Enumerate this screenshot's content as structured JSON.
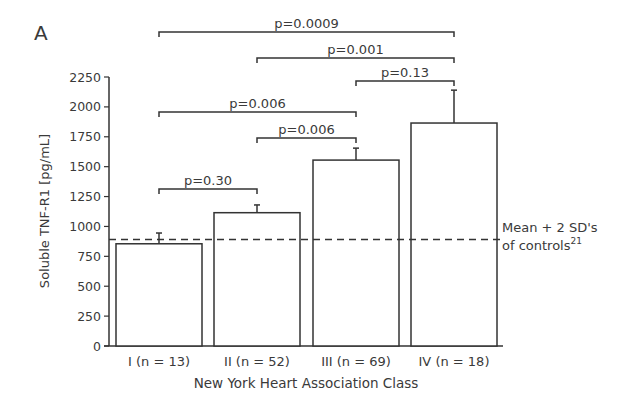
{
  "panel_label": "A",
  "chart_data": {
    "type": "bar",
    "title": "",
    "xlabel": "New York Heart Association Class",
    "ylabel": "Soluble TNF-R1 [pg/mL]",
    "ylim": [
      0,
      2250
    ],
    "yticks": [
      0,
      250,
      500,
      750,
      1000,
      1250,
      1500,
      1750,
      2000,
      2250
    ],
    "grid": false,
    "categories": [
      "I (n = 13)",
      "II (n = 52)",
      "III (n = 69)",
      "IV (n = 18)"
    ],
    "values": [
      855,
      1115,
      1555,
      1865
    ],
    "error_upper": [
      945,
      1180,
      1655,
      2140
    ],
    "reference_line": {
      "value": 890,
      "style": "dashed",
      "label_line1": "Mean + 2 SD's",
      "label_line2": "of controls",
      "label_superscript": "21"
    },
    "comparisons": [
      {
        "from": 0,
        "to": 1,
        "label": "p=0.30"
      },
      {
        "from": 1,
        "to": 2,
        "label": "p=0.006"
      },
      {
        "from": 0,
        "to": 2,
        "label": "p=0.006"
      },
      {
        "from": 2,
        "to": 3,
        "label": "p=0.13"
      },
      {
        "from": 1,
        "to": 3,
        "label": "p=0.001"
      },
      {
        "from": 0,
        "to": 3,
        "label": "p=0.0009"
      }
    ],
    "colors": {
      "bar_fill": "#ffffff",
      "stroke": "#333333",
      "text": "#3a3a3a"
    }
  }
}
